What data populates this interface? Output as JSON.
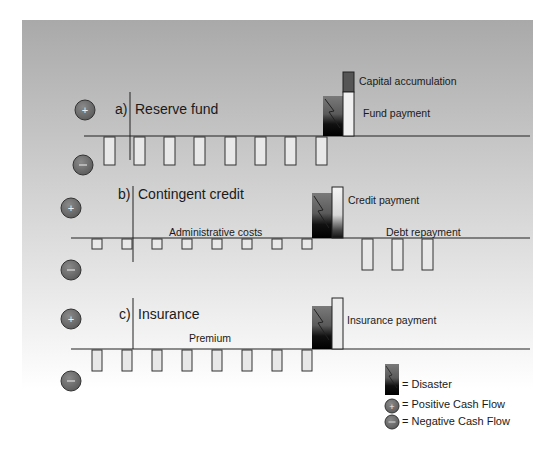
{
  "panels": [
    {
      "id": "a",
      "letter": "a)",
      "title": "Reserve fund",
      "annotations": {
        "top_block": "Capital accumulation",
        "payment": "Fund payment"
      },
      "negative_flows_before_disaster": 8,
      "negative_flows_after_disaster": 0
    },
    {
      "id": "b",
      "letter": "b)",
      "title": "Contingent credit",
      "annotations": {
        "periodic_costs": "Administrative costs",
        "payment": "Credit payment",
        "after_costs": "Debt repayment"
      },
      "negative_flows_before_disaster": 8,
      "negative_flows_after_disaster": 3
    },
    {
      "id": "c",
      "letter": "c)",
      "title": "Insurance",
      "annotations": {
        "periodic_costs": "Premium",
        "payment": "Insurance payment"
      },
      "negative_flows_before_disaster": 8,
      "negative_flows_after_disaster": 0
    }
  ],
  "legend": {
    "disaster": "= Disaster",
    "positive": "= Positive Cash Flow",
    "negative": "= Negative Cash Flow"
  },
  "symbols": {
    "plus": "+",
    "minus": "−"
  },
  "colors": {
    "bar_fill": "#e8e8e8",
    "bar_stroke": "#333333",
    "capital_block": "#555555",
    "circle_fill": "#6e6e6e",
    "axis": "#222222"
  }
}
